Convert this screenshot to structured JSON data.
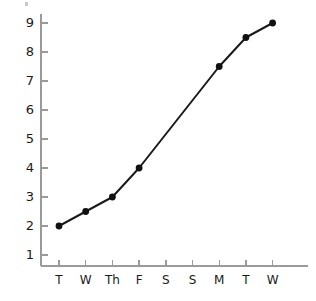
{
  "chart_data": {
    "type": "line",
    "title": "",
    "subtitle": "",
    "xlabel": "",
    "ylabel": "",
    "categories": [
      "T",
      "W",
      "Th",
      "F",
      "S",
      "S",
      "M",
      "T",
      "W"
    ],
    "values": [
      2,
      2.5,
      3,
      4,
      null,
      null,
      7.5,
      8.5,
      9
    ],
    "marked_points": [
      {
        "category": "T",
        "value": 2
      },
      {
        "category": "W",
        "value": 2.5
      },
      {
        "category": "Th",
        "value": 3
      },
      {
        "category": "F",
        "value": 4
      },
      {
        "category": "M",
        "value": 7.5
      },
      {
        "category": "T",
        "value": 8.5
      },
      {
        "category": "W",
        "value": 9
      }
    ],
    "ytick_labels": [
      "1",
      "2",
      "3",
      "4",
      "5",
      "6",
      "7",
      "8",
      "9"
    ],
    "ytick_values": [
      1,
      2,
      3,
      4,
      5,
      6,
      7,
      8,
      9
    ],
    "ylim": [
      0,
      9.4
    ],
    "xlim": [
      -0.5,
      8.9
    ],
    "grid": false,
    "legend": null,
    "series": [
      {
        "name": "series-1",
        "values": [
          2,
          2.5,
          3,
          4,
          null,
          null,
          7.5,
          8.5,
          9
        ]
      }
    ],
    "annotations": []
  },
  "style": {
    "line_color": "#1a1a1a",
    "marker_color": "#111111",
    "axis_color": "#9a9a9a",
    "text_color": "#1a1a1a",
    "background_color": "#ffffff",
    "line_width": 2.0,
    "marker_radius": 3.4
  },
  "geometry": {
    "axis_x": 41,
    "axis_y": 266,
    "axis_top": 14,
    "axis_right": 308,
    "y_value_1_px": 255,
    "y_unit_px": 29,
    "x_first_px": 59,
    "x_step_px": 26.7,
    "tick_len_x": 6,
    "tick_len_y": 7
  }
}
